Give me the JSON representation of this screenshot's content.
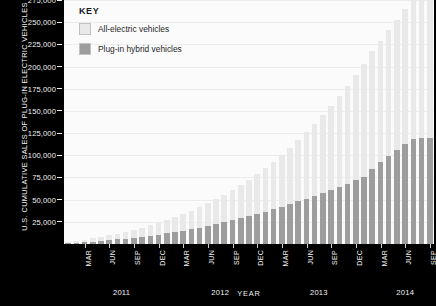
{
  "chart_data": {
    "type": "bar",
    "stacked": true,
    "title": "U.S. CUMULATIVE SALES OF PLUG-IN ELECTRIC VEHICLES",
    "xlabel": "YEAR",
    "ylabel": "U.S. CUMULATIVE SALES OF PLUG-IN ELECTRIC VEHICLES",
    "ylim": [
      0,
      275000
    ],
    "ytick_values": [
      275000,
      250000,
      225000,
      200000,
      175000,
      150000,
      125000,
      100000,
      75000,
      50000,
      25000
    ],
    "ytick_labels": [
      "275,000",
      "250,000",
      "225,000",
      "200,000",
      "175,000",
      "150,000",
      "125,000",
      "100,000",
      "75,000",
      "50,000",
      "25,000"
    ],
    "grid": true,
    "legend_position": "top-left",
    "legend_title": "KEY",
    "series": [
      {
        "name": "All-electric vehicles",
        "color": "#e9e9e9",
        "values": [
          1200,
          1900,
          2700,
          3600,
          4500,
          5500,
          6600,
          7700,
          8900,
          10200,
          11600,
          13100,
          14700,
          16400,
          18400,
          20500,
          22800,
          25300,
          28000,
          30900,
          34000,
          37400,
          41000,
          44900,
          49000,
          53400,
          58200,
          63300,
          68800,
          74700,
          81000,
          87700,
          94800,
          102400,
          110400,
          118900,
          127800,
          132200,
          136900,
          141800,
          146900,
          152200,
          157700,
          163500,
          169500
        ]
      },
      {
        "name": "Plug-in hybrid vehicles",
        "color": "#9d9d9d",
        "values": [
          900,
          1400,
          2000,
          2700,
          3400,
          4200,
          5100,
          6000,
          7000,
          8100,
          9300,
          10600,
          12000,
          13500,
          15100,
          16800,
          18600,
          20500,
          22500,
          24600,
          26800,
          29100,
          31500,
          34000,
          36600,
          39300,
          42100,
          45000,
          48000,
          51100,
          54300,
          57600,
          61000,
          64500,
          68100,
          71800,
          75600,
          85000,
          92000,
          99000,
          106000,
          113000,
          120000,
          126000,
          131000
        ]
      }
    ],
    "x_tick_months": [
      "MAR",
      "JUN",
      "SEP",
      "DEC",
      "MAR",
      "JUN",
      "SEP",
      "DEC",
      "MAR",
      "JUN",
      "SEP",
      "DEC",
      "MAR",
      "JUN",
      "SEP"
    ],
    "x_tick_indices": [
      2,
      5,
      8,
      11,
      14,
      17,
      20,
      23,
      26,
      29,
      32,
      35,
      38,
      41,
      44
    ],
    "years": [
      {
        "label": "2011",
        "center_index": 6.5
      },
      {
        "label": "2012",
        "center_index": 18.5
      },
      {
        "label": "2013",
        "center_index": 30.5
      },
      {
        "label": "2014",
        "center_index": 41.0
      }
    ],
    "n_points": 45
  },
  "legend": {
    "title": "KEY",
    "items": [
      {
        "label": "All-electric vehicles",
        "color": "#e9e9e9"
      },
      {
        "label": "Plug-in hybrid vehicles",
        "color": "#9d9d9d"
      }
    ]
  },
  "axis": {
    "y_title": "U.S. CUMULATIVE SALES OF PLUG-IN ELECTRIC VEHICLES",
    "x_title": "YEAR"
  }
}
